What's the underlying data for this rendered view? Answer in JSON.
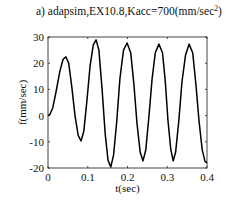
{
  "chart_data": {
    "type": "line",
    "title": "a) adapsim,EX10.8,Kacc=700(mm/sec",
    "title_sup": "2",
    "title_end": ")",
    "xlabel": "t(sec)",
    "ylabel": "f(mm/sec)",
    "xlim": [
      0,
      0.4
    ],
    "ylim": [
      -20,
      30
    ],
    "xticks": [
      0,
      0.1,
      0.2,
      0.3,
      0.4
    ],
    "xtick_labels": [
      "0",
      "0.1",
      "0.2",
      "0.3",
      "0.4"
    ],
    "yticks": [
      -20,
      -10,
      0,
      10,
      20,
      30
    ],
    "ytick_labels": [
      "-20",
      "-10",
      "0",
      "10",
      "20",
      "30"
    ],
    "grid": false,
    "legend": null,
    "series": [
      {
        "name": "f",
        "color": "#000000",
        "x": [
          0,
          0.005,
          0.012,
          0.02,
          0.03,
          0.038,
          0.045,
          0.052,
          0.06,
          0.068,
          0.076,
          0.083,
          0.09,
          0.098,
          0.106,
          0.114,
          0.121,
          0.128,
          0.136,
          0.144,
          0.151,
          0.158,
          0.165,
          0.173,
          0.181,
          0.19,
          0.199,
          0.208,
          0.216,
          0.224,
          0.232,
          0.239,
          0.246,
          0.254,
          0.262,
          0.27,
          0.279,
          0.288,
          0.295,
          0.302,
          0.309,
          0.315,
          0.321,
          0.329,
          0.337,
          0.346,
          0.355,
          0.364,
          0.372,
          0.38,
          0.388,
          0.395,
          0.4
        ],
        "y": [
          0,
          0.5,
          3,
          9,
          17,
          21.5,
          22.4,
          20,
          11,
          0,
          -7.5,
          -9.7,
          -6,
          6,
          19,
          27,
          28.9,
          25,
          10,
          -7,
          -17,
          -19.6,
          -15,
          -2,
          14,
          25,
          27.7,
          24,
          12,
          -3,
          -14,
          -17.3,
          -13,
          0,
          14,
          24,
          27.3,
          24,
          13,
          -2,
          -13,
          -17.3,
          -14,
          -2,
          13,
          23,
          27.3,
          24,
          12,
          -2,
          -13,
          -17.5,
          -18
        ]
      }
    ]
  },
  "annotations": {
    "panel_label": "a)"
  }
}
